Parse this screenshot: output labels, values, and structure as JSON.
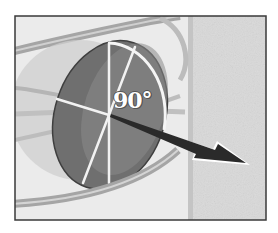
{
  "diagram": {
    "angle_label": "90°",
    "elements": [
      {
        "id": "frame",
        "type": "border-box"
      },
      {
        "id": "background-panel-right",
        "type": "textured-panel"
      },
      {
        "id": "orbit-ring-back",
        "type": "ellipse-ring"
      },
      {
        "id": "translucent-sphere",
        "type": "circle"
      },
      {
        "id": "disc",
        "type": "ellipse-plane"
      },
      {
        "id": "disc-spokes",
        "type": "lines"
      },
      {
        "id": "angle-arc",
        "type": "arc"
      },
      {
        "id": "normal-vector-arrow",
        "type": "arrow"
      },
      {
        "id": "orbit-ring-front",
        "type": "ellipse-ring"
      }
    ],
    "colors": {
      "frame_border": "#3a3a3a",
      "background_left": "#e9e9e9",
      "background_right": "#d8d8d8",
      "ring": "#a9a9a9",
      "sphere": "#c8c8c8",
      "disc": "#6e6e6e",
      "disc_light": "#8a8a8a",
      "spoke": "#f2f2f2",
      "arrow": "#2a2a2a",
      "arrow_outline": "#ffffff"
    }
  }
}
